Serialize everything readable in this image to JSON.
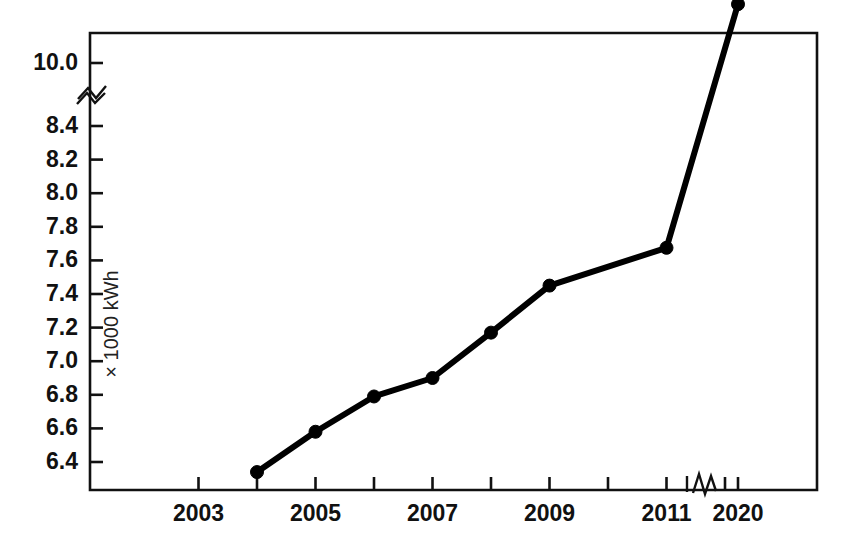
{
  "chart_data": {
    "type": "line",
    "title": "",
    "subtitle": "",
    "xlabel": "",
    "ylabel": "× 1000 kWh",
    "grid": false,
    "legend": null,
    "axis_break_y": true,
    "axis_break_x": true,
    "x": [
      2004,
      2005,
      2006,
      2007,
      2008,
      2009,
      2011,
      2020
    ],
    "values": [
      6.34,
      6.58,
      6.79,
      6.9,
      7.17,
      7.45,
      8.9,
      10.35
    ],
    "series": [
      {
        "name": "Electricity consumption",
        "x": [
          2004,
          2005,
          2006,
          2007,
          2008,
          2009,
          2011,
          2020
        ],
        "values": [
          6.34,
          6.58,
          6.79,
          6.9,
          7.17,
          7.45,
          8.9,
          10.35
        ]
      }
    ],
    "ylim": [
      6.3,
      10.35
    ],
    "yticks": [
      6.4,
      6.6,
      6.8,
      7.0,
      7.2,
      7.4,
      7.6,
      7.8,
      8.0,
      8.2,
      8.4,
      10.0
    ],
    "ytick_labels": [
      "6.4",
      "6.6",
      "6.8",
      "7.0",
      "7.2",
      "7.4",
      "7.6",
      "7.8",
      "8.0",
      "8.2",
      "8.4",
      "10.0"
    ],
    "xlim": [
      2002,
      2021
    ],
    "xticks": [
      2003,
      2004,
      2005,
      2006,
      2007,
      2008,
      2009,
      2010,
      2011,
      2012,
      2020
    ],
    "xtick_labels": [
      "2003",
      "",
      "2005",
      "",
      "2007",
      "",
      "2009",
      "",
      "2011",
      "",
      "2020"
    ],
    "xtick_labels_shown": [
      "2003",
      "2005",
      "2007",
      "2009",
      "2011",
      "2020"
    ],
    "marker": "filled-circle",
    "line_color": "#000000",
    "background_color": "#ffffff",
    "axis_color": "#111111"
  }
}
